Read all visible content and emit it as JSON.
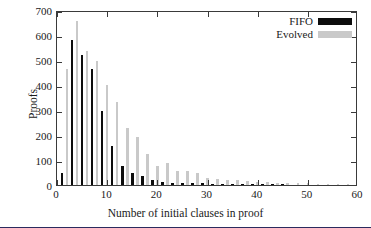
{
  "chart_data": {
    "type": "bar",
    "title": "",
    "xlabel": "Number of initial clauses in proof",
    "ylabel": "Proofs",
    "xlim": [
      0,
      60
    ],
    "ylim": [
      0,
      700
    ],
    "xticks": [
      0,
      10,
      20,
      30,
      40,
      50,
      60
    ],
    "yticks": [
      0,
      100,
      200,
      300,
      400,
      500,
      600,
      700
    ],
    "grid": false,
    "legend_position": "top-right",
    "colors": {
      "FIFO": "#0d0d0d",
      "Evolved": "#c9c9c9"
    },
    "x": [
      1,
      2,
      3,
      4,
      5,
      6,
      7,
      8,
      9,
      10,
      11,
      12,
      13,
      14,
      15,
      16,
      17,
      18,
      19,
      20,
      21,
      22,
      23,
      24,
      25,
      26,
      27,
      28,
      29,
      30,
      31,
      32,
      33,
      34,
      35,
      36,
      37,
      38,
      39,
      40,
      41,
      42,
      43,
      44,
      45,
      46,
      47,
      48,
      49,
      50,
      51,
      52,
      53,
      54,
      55,
      56,
      57,
      58,
      59
    ],
    "series": [
      {
        "name": "FIFO",
        "values": [
          48,
          0,
          580,
          0,
          520,
          0,
          465,
          0,
          298,
          0,
          158,
          0,
          75,
          0,
          50,
          0,
          38,
          0,
          22,
          0,
          14,
          0,
          10,
          0,
          10,
          0,
          9,
          0,
          7,
          0,
          5,
          0,
          5,
          0,
          4,
          0,
          2,
          0,
          2,
          0,
          1,
          0,
          1,
          0,
          1,
          0,
          0,
          0,
          0,
          0,
          0,
          0,
          0,
          0,
          0,
          0,
          0,
          0,
          0
        ]
      },
      {
        "name": "Evolved",
        "values": [
          0,
          463,
          0,
          655,
          0,
          538,
          0,
          498,
          0,
          400,
          0,
          333,
          0,
          230,
          0,
          193,
          0,
          125,
          0,
          78,
          0,
          87,
          0,
          55,
          0,
          55,
          0,
          48,
          0,
          30,
          0,
          25,
          0,
          22,
          0,
          20,
          0,
          16,
          0,
          14,
          0,
          12,
          0,
          10,
          0,
          9,
          0,
          8,
          0,
          7,
          0,
          6,
          0,
          5,
          0,
          4,
          0,
          3,
          0
        ]
      }
    ],
    "legend_entries": [
      {
        "label": "FIFO",
        "color": "#0d0d0d"
      },
      {
        "label": "Evolved",
        "color": "#c9c9c9"
      }
    ]
  }
}
